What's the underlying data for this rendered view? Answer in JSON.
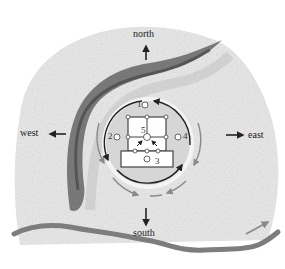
{
  "directions": {
    "north": "north",
    "south": "south",
    "east": "east",
    "west": "west"
  },
  "markers": {
    "m1": "1",
    "m2": "2",
    "m3": "3",
    "m4": "4",
    "m5": "5"
  },
  "colors": {
    "terrain_light": "#e6e6e6",
    "ridge_dark": "#5a5a5a",
    "river": "#7d7d7d",
    "circle_fill": "#d9d9d9",
    "ink": "#222222",
    "gray_arrow": "#8a8a8a"
  }
}
